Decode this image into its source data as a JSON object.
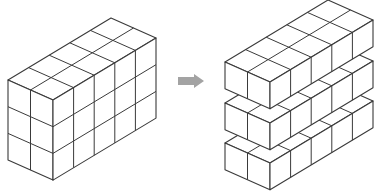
{
  "diagram": {
    "colors": {
      "background": "#ffffff",
      "line": "#3a3a3a",
      "face": "#ffffff",
      "arrow": "#a3a3a3"
    },
    "cube_vectors": {
      "depth": [
        -22.5,
        -10
      ],
      "length": [
        20.6,
        -12.4
      ],
      "height": 26.7
    },
    "left_block": {
      "name": "whole-cuboid",
      "front_corner_top": [
        53,
        100
      ],
      "depth_cubes": 2,
      "length_cubes": 5,
      "height_cubes": 3,
      "layers": [
        {
          "front_corner_top": [
            53,
            100
          ],
          "height_cubes": 3
        }
      ]
    },
    "arrow": {
      "direction": "right",
      "x_start": 178,
      "x_end": 204,
      "y_center": 81,
      "shaft_height": 8,
      "head_height": 14,
      "head_length": 10
    },
    "right_block": {
      "name": "separated-layers",
      "depth_cubes": 2,
      "length_cubes": 5,
      "layers": [
        {
          "label": "layer-top",
          "front_corner_top": [
            270,
            82
          ],
          "height_cubes": 1
        },
        {
          "label": "layer-middle",
          "front_corner_top": [
            270,
            123
          ],
          "height_cubes": 1
        },
        {
          "label": "layer-bottom",
          "front_corner_top": [
            270,
            163
          ],
          "height_cubes": 1
        }
      ]
    }
  }
}
